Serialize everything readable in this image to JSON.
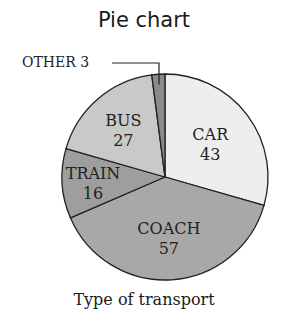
{
  "chart_data": {
    "type": "pie",
    "title": "Pie chart",
    "xlabel": "Type of transport",
    "ylabel": "",
    "start_angle": "12 o'clock, clockwise",
    "categories": [
      "CAR",
      "COACH",
      "TRAIN",
      "BUS",
      "OTHER"
    ],
    "values": [
      43,
      57,
      16,
      27,
      3
    ],
    "colors": [
      "#eeeeee",
      "#a8a8a8",
      "#9e9e9e",
      "#c9c9c9",
      "#8a8a8a"
    ],
    "labels": [
      "CAR 43",
      "COACH 57",
      "TRAIN 16",
      "BUS 27",
      "OTHER 3"
    ],
    "total": 146
  }
}
